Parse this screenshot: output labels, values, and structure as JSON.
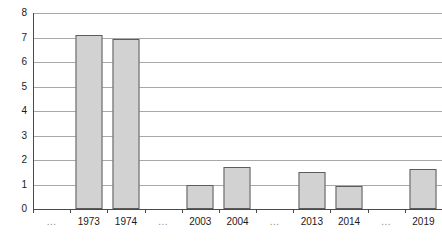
{
  "chart_data": {
    "type": "bar",
    "title": "",
    "subtitle": "",
    "xlabel": "",
    "ylabel": "",
    "categories": [
      "...",
      "1973",
      "1974",
      "...",
      "2003",
      "2004",
      "...",
      "2013",
      "2014",
      "...",
      "2019"
    ],
    "values": [
      0,
      7.1,
      6.95,
      0,
      1.0,
      1.7,
      0,
      1.5,
      0.95,
      0,
      1.62
    ],
    "series": [
      {
        "name": "",
        "values": [
          0,
          7.1,
          6.95,
          0,
          1.0,
          1.7,
          0,
          1.5,
          0.95,
          0,
          1.62
        ]
      }
    ],
    "ylim": [
      0,
      8
    ],
    "xlim": null,
    "y_ticks": [
      0,
      1,
      2,
      3,
      4,
      5,
      6,
      7,
      8
    ],
    "y_tick_labels": [
      "0",
      "1",
      "2",
      "3",
      "4",
      "5",
      "6",
      "7",
      "8"
    ],
    "grid": true,
    "grid_axis": "y",
    "legend": false,
    "legend_position": "none",
    "annotations": [],
    "bar_fill_color": "#d2d2d2",
    "bar_edge_color": "#5c5c5c",
    "gridline_color": "#a8a8a8",
    "axis_color": "#4a4a4a",
    "text_color": "#1a1a1a",
    "background_color": "#ffffff",
    "ellipsis_label": "...",
    "ellipsis_indices": [
      0,
      3,
      6,
      9
    ]
  }
}
